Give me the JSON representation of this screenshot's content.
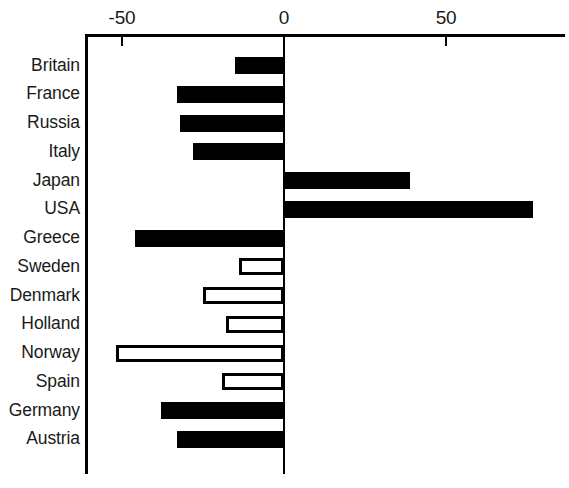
{
  "chart_data": {
    "type": "bar",
    "orientation": "horizontal",
    "title": "",
    "subtitle": "",
    "xlabel": "",
    "ylabel": "",
    "xlim": [
      -60,
      87
    ],
    "ticks": [
      -50,
      0,
      50
    ],
    "tick_labels": [
      "-50",
      "0",
      "50"
    ],
    "grid": false,
    "legend": null,
    "zero_reference_line": true,
    "categories": [
      "Britain",
      "France",
      "Russia",
      "Italy",
      "Japan",
      "USA",
      "Greece",
      "Sweden",
      "Denmark",
      "Holland",
      "Norway",
      "Spain",
      "Germany",
      "Austria"
    ],
    "values": [
      -15,
      -33,
      -32,
      -28,
      39,
      77,
      -46,
      -14,
      -25,
      -18,
      -52,
      -19,
      -38,
      -33
    ],
    "styles": [
      "filled",
      "filled",
      "filled",
      "filled",
      "filled",
      "filled",
      "filled",
      "hollow",
      "hollow",
      "hollow",
      "hollow",
      "hollow",
      "filled",
      "filled"
    ],
    "series": [
      {
        "name": "value",
        "points": [
          {
            "category": "Britain",
            "value": -15,
            "style": "filled"
          },
          {
            "category": "France",
            "value": -33,
            "style": "filled"
          },
          {
            "category": "Russia",
            "value": -32,
            "style": "filled"
          },
          {
            "category": "Italy",
            "value": -28,
            "style": "filled"
          },
          {
            "category": "Japan",
            "value": 39,
            "style": "filled"
          },
          {
            "category": "USA",
            "value": 77,
            "style": "filled"
          },
          {
            "category": "Greece",
            "value": -46,
            "style": "filled"
          },
          {
            "category": "Sweden",
            "value": -14,
            "style": "hollow"
          },
          {
            "category": "Denmark",
            "value": -25,
            "style": "hollow"
          },
          {
            "category": "Holland",
            "value": -18,
            "style": "hollow"
          },
          {
            "category": "Norway",
            "value": -52,
            "style": "hollow"
          },
          {
            "category": "Spain",
            "value": -19,
            "style": "hollow"
          },
          {
            "category": "Germany",
            "value": -38,
            "style": "filled"
          },
          {
            "category": "Austria",
            "value": -33,
            "style": "filled"
          }
        ]
      }
    ],
    "colors": {
      "filled_bar": "#000000",
      "hollow_bar_fill": "#ffffff",
      "hollow_bar_stroke": "#000000",
      "axis": "#000000",
      "text": "#1a1a1a",
      "background": "#ffffff"
    }
  }
}
